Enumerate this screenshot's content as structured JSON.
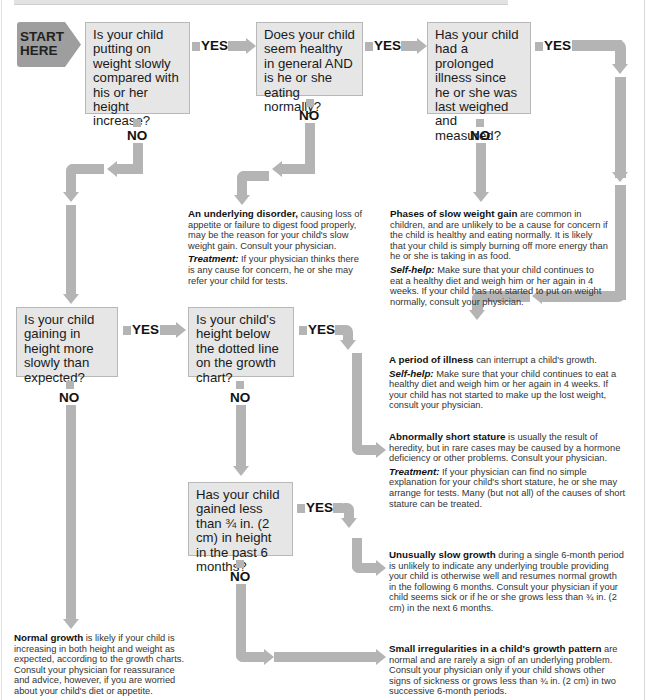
{
  "start": {
    "label_line1": "START",
    "label_line2": "HERE"
  },
  "labels": {
    "yes": "YES",
    "no": "NO"
  },
  "questions": {
    "q1": "Is your child putting on weight slowly compared with his or her height increase?",
    "q2": "Does your child seem healthy in general AND is he or she eating normally?",
    "q3": "Has your child had a prolonged illness since he or she was last weighed and measured?",
    "q4": "Is your child gaining in height more slowly than expected?",
    "q5": "Is your child's height below the dotted line on the growth chart?",
    "q6": "Has your child gained less than ¾ in. (2 cm) in height in the past 6 months?"
  },
  "outcomes": {
    "underlying_disorder": {
      "title": "An underlying disorder,",
      "body": " causing loss of appetite or failure to digest food properly, may be the reason for your child's slow weight gain. Consult your physician.",
      "sub_title": "Treatment:",
      "sub_body": " If your physician thinks there is any cause for concern, he or she may refer your child for tests."
    },
    "slow_weight_gain": {
      "title": "Phases of slow weight gain",
      "body": " are common in children, and are unlikely to be a cause for concern if the child is healthy and eating normally. It is likely that your child is simply burning off more energy than he or she is taking in as food.",
      "sub_title": "Self-help:",
      "sub_body": " Make sure that your child continues to eat a healthy diet and weigh him or her again in 4 weeks. If your child has not started to put on weight normally, consult your physician."
    },
    "period_of_illness": {
      "title": "A period of illness",
      "body": " can interrupt a child's growth.",
      "sub_title": "Self-help:",
      "sub_body": " Make sure that your child continues to eat a healthy diet and weigh him or her again in 4 weeks. If your child has not started to make up the lost weight, consult your physician."
    },
    "short_stature": {
      "title": "Abnormally short stature",
      "body": " is usually the result of heredity, but in rare cases may be caused by a hormone deficiency or other problems. Consult your physician.",
      "sub_title": "Treatment:",
      "sub_body": " If your physician can find no simple explanation for your child's short stature, he or she may arrange for tests. Many (but not all) of the causes of short stature can be treated."
    },
    "slow_growth": {
      "title": "Unusually slow growth",
      "body": " during a single 6-month period is unlikely to indicate any underlying trouble providing your child is otherwise well and resumes normal growth in the following 6 months. Consult your physician if your child seems sick or if he or she grows less than ¾ in. (2 cm) in the next 6 months."
    },
    "normal_growth": {
      "title": "Normal growth",
      "body": " is likely if your child is increasing in both height and weight as expected, according to the growth charts. Consult your physician for reassurance and advice, however, if you are worried about your child's diet or appetite."
    },
    "small_irregularities": {
      "title": "Small irregularities in a child's growth pattern",
      "body": " are normal and are rarely a sign of an underlying problem. Consult your physician only if your child shows other signs of sickness or grows less than ¾ in. (2 cm) in two successive 6-month periods."
    }
  },
  "colors": {
    "arrow": "#b4b4b4",
    "box_fill": "#e6e6e6",
    "start_fill": "#9e9e9e"
  }
}
